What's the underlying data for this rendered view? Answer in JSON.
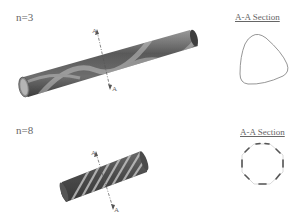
{
  "figure": {
    "panels": [
      {
        "id": "n3",
        "label": "n=3",
        "lobes": 3,
        "section_title": "A-A Section",
        "cut_marker_top": "A",
        "cut_marker_bottom": "A"
      },
      {
        "id": "n8",
        "label": "n=8",
        "lobes": 8,
        "section_title": "A-A Section",
        "cut_marker_top": "A",
        "cut_marker_bottom": "A"
      }
    ],
    "colors": {
      "tube_dark": "#4a4a4a",
      "tube_light": "#c8c8c8",
      "section_line": "#777777",
      "text": "#666666"
    }
  }
}
